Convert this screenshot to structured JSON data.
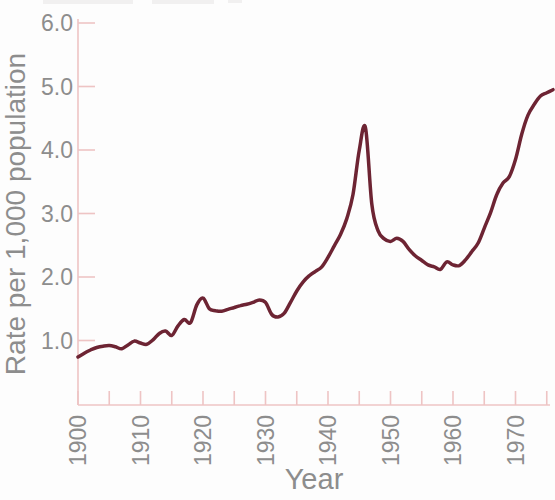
{
  "chart_data": {
    "type": "line",
    "title": "",
    "xlabel": "Year",
    "ylabel": "Rate per 1,000 population",
    "x_axis": {
      "min": 1900,
      "max": 1976,
      "tick_step": 5,
      "last_tick": 1975,
      "tick_labels": [
        "1900",
        "1910",
        "1920",
        "1930",
        "1940",
        "1950",
        "1960",
        "1970"
      ],
      "tick_label_years": [
        1900,
        1910,
        1920,
        1930,
        1940,
        1950,
        1960,
        1970
      ],
      "tick_label_rotation_deg": -90
    },
    "y_axis": {
      "min": 0,
      "max": 6,
      "tick_values": [
        6,
        5,
        4,
        3,
        2,
        1
      ],
      "tick_labels": [
        "6.0",
        "5.0",
        "4.0",
        "3.0",
        "2.0",
        "1.0"
      ],
      "grid": false
    },
    "legend": "none",
    "series": [
      {
        "name": "",
        "x": [
          1900,
          1901,
          1902,
          1903,
          1904,
          1905,
          1906,
          1907,
          1908,
          1909,
          1910,
          1911,
          1912,
          1913,
          1914,
          1915,
          1916,
          1917,
          1918,
          1919,
          1920,
          1921,
          1922,
          1923,
          1924,
          1925,
          1926,
          1927,
          1928,
          1929,
          1930,
          1931,
          1932,
          1933,
          1934,
          1935,
          1936,
          1937,
          1938,
          1939,
          1940,
          1941,
          1942,
          1943,
          1944,
          1945,
          1946,
          1947,
          1948,
          1949,
          1950,
          1951,
          1952,
          1953,
          1954,
          1955,
          1956,
          1957,
          1958,
          1959,
          1960,
          1961,
          1962,
          1963,
          1964,
          1965,
          1966,
          1967,
          1968,
          1969,
          1970,
          1971,
          1972,
          1973,
          1974,
          1975,
          1976
        ],
        "y": [
          0.74,
          0.8,
          0.85,
          0.89,
          0.91,
          0.92,
          0.9,
          0.87,
          0.93,
          0.99,
          0.96,
          0.94,
          1.01,
          1.11,
          1.15,
          1.08,
          1.23,
          1.33,
          1.28,
          1.56,
          1.67,
          1.5,
          1.47,
          1.46,
          1.49,
          1.52,
          1.55,
          1.57,
          1.6,
          1.64,
          1.6,
          1.41,
          1.37,
          1.43,
          1.6,
          1.78,
          1.92,
          2.02,
          2.09,
          2.16,
          2.31,
          2.49,
          2.67,
          2.92,
          3.3,
          4.0,
          4.35,
          3.15,
          2.73,
          2.6,
          2.56,
          2.61,
          2.56,
          2.43,
          2.33,
          2.26,
          2.19,
          2.16,
          2.12,
          2.24,
          2.19,
          2.18,
          2.27,
          2.4,
          2.53,
          2.77,
          3.01,
          3.3,
          3.48,
          3.58,
          3.85,
          4.25,
          4.55,
          4.72,
          4.85,
          4.9,
          4.95
        ]
      }
    ],
    "colors": {
      "line": "#6d2433",
      "axis": "#eec4c4",
      "text": "#8d8d8d",
      "background": "#fdfdfd"
    },
    "annotations": [],
    "notes_peak": {
      "year": 1946,
      "value": 4.35
    },
    "notes_start": {
      "year": 1900,
      "value": 0.74
    },
    "notes_end": {
      "year": 1976,
      "value": 4.95
    }
  }
}
